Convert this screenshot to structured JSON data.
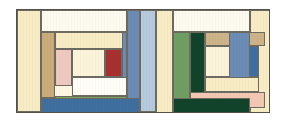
{
  "artwork": {
    "title": "Two Log Cabin Quilt Blocks",
    "width": 286,
    "height": 123,
    "background": "#ffffff",
    "frame": {
      "x": 16,
      "y": 9,
      "width": 254,
      "height": 104,
      "border_color": "#55514a",
      "fill": "#fdf6e0"
    },
    "palette": {
      "cream": "#f7ecc4",
      "pale_cream": "#fbf4db",
      "ivory": "#fdfaf0",
      "white": "#fefdf7",
      "tan": "#c9ac79",
      "tan_light": "#cdb488",
      "pink": "#efc9c0",
      "salmon": "#f2c8b4",
      "red": "#a8302f",
      "blue": "#6b8cb5",
      "blue_light": "#b5cadd",
      "blue_deep": "#3f6f9e",
      "green": "#7ba35a",
      "green_mid": "#6f9e62",
      "green_dark": "#11432b"
    },
    "blocks": [
      {
        "name": "left-block",
        "patches": [
          {
            "id": "l-outer-left-cream",
            "color": "#f7ecc4",
            "x": 0,
            "y": 0,
            "w": 24,
            "h": 102
          },
          {
            "id": "l-top-white",
            "color": "#fdfaf0",
            "x": 24,
            "y": 0,
            "w": 86,
            "h": 22
          },
          {
            "id": "l-right-blue",
            "color": "#6b8cb5",
            "x": 110,
            "y": 0,
            "w": 13,
            "h": 102
          },
          {
            "id": "l-right-blue-light",
            "color": "#b5cadd",
            "x": 123,
            "y": 0,
            "w": 16,
            "h": 102
          },
          {
            "id": "l-tan-column",
            "color": "#c9ac79",
            "x": 24,
            "y": 22,
            "w": 14,
            "h": 66
          },
          {
            "id": "l-cream-top-bar",
            "color": "#f7ecc4",
            "x": 38,
            "y": 22,
            "w": 72,
            "h": 17
          },
          {
            "id": "l-pink-column",
            "color": "#efc9c0",
            "x": 38,
            "y": 39,
            "w": 17,
            "h": 37
          },
          {
            "id": "l-center-cream",
            "color": "#fbf4db",
            "x": 55,
            "y": 39,
            "w": 33,
            "h": 28
          },
          {
            "id": "l-red-square",
            "color": "#a8302f",
            "x": 88,
            "y": 39,
            "w": 17,
            "h": 28
          },
          {
            "id": "l-center-right-blue",
            "color": "#6b8cb5",
            "x": 105,
            "y": 22,
            "w": 5,
            "h": 54
          },
          {
            "id": "l-white-bar",
            "color": "#fefdf7",
            "x": 55,
            "y": 67,
            "w": 55,
            "h": 19
          },
          {
            "id": "l-green-bar",
            "color": "#7ba35a",
            "x": 38,
            "y": 86,
            "w": 72,
            "h": 16
          },
          {
            "id": "l-bottom-blue",
            "color": "#3f6f9e",
            "x": 24,
            "y": 88,
            "w": 99,
            "h": 16
          }
        ]
      },
      {
        "name": "center-sash",
        "patches": [
          {
            "id": "c-cream-sash",
            "color": "#f7ecc4",
            "x": 139,
            "y": 0,
            "w": 17,
            "h": 104
          }
        ]
      },
      {
        "name": "right-block",
        "patches": [
          {
            "id": "r-top-white",
            "color": "#fdfaf0",
            "x": 156,
            "y": 0,
            "w": 77,
            "h": 22
          },
          {
            "id": "r-outer-right-cream",
            "color": "#f7ecc4",
            "x": 233,
            "y": 0,
            "w": 21,
            "h": 104
          },
          {
            "id": "r-green-column",
            "color": "#6f9e62",
            "x": 156,
            "y": 22,
            "w": 17,
            "h": 76
          },
          {
            "id": "r-dark-green-col",
            "color": "#11432b",
            "x": 173,
            "y": 22,
            "w": 15,
            "h": 62
          },
          {
            "id": "r-tan-top-bar",
            "color": "#cdb488",
            "x": 188,
            "y": 22,
            "w": 60,
            "h": 14
          },
          {
            "id": "r-center-cream",
            "color": "#fbf4db",
            "x": 188,
            "y": 36,
            "w": 38,
            "h": 31
          },
          {
            "id": "r-blue-deep-square",
            "color": "#3f6f9e",
            "x": 226,
            "y": 36,
            "w": 16,
            "h": 31
          },
          {
            "id": "r-right-blue-col",
            "color": "#6b8cb5",
            "x": 212,
            "y": 22,
            "w": 21,
            "h": 70
          },
          {
            "id": "r-cream-lower-bar",
            "color": "#f7ecc4",
            "x": 188,
            "y": 67,
            "w": 54,
            "h": 15
          },
          {
            "id": "r-salmon-bar",
            "color": "#f2c8b4",
            "x": 173,
            "y": 82,
            "w": 75,
            "h": 16
          },
          {
            "id": "r-bottom-dark-green",
            "color": "#11432b",
            "x": 156,
            "y": 88,
            "w": 77,
            "h": 16
          }
        ]
      }
    ]
  }
}
